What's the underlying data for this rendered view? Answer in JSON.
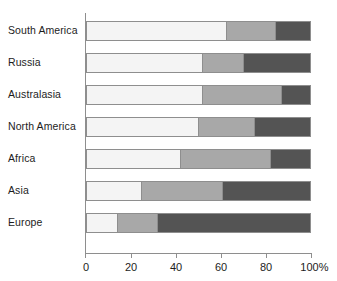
{
  "chart_data": {
    "type": "bar",
    "orientation": "horizontal",
    "stacked": true,
    "normalized": true,
    "title": "",
    "xlabel": "",
    "ylabel": "",
    "xlim": [
      0,
      100
    ],
    "grid": false,
    "legend": "none",
    "categories": [
      "South America",
      "Russia",
      "Australasia",
      "North America",
      "Africa",
      "Asia",
      "Europe"
    ],
    "series": [
      {
        "name": "segment-1",
        "color": "#f4f4f4",
        "values": [
          62.5,
          51.5,
          51.5,
          50.0,
          41.5,
          24.0,
          13.5
        ]
      },
      {
        "name": "segment-2",
        "color": "#a8a8a8",
        "values": [
          22.0,
          18.5,
          35.5,
          25.0,
          40.5,
          36.5,
          18.0
        ]
      },
      {
        "name": "segment-3",
        "color": "#545454",
        "values": [
          15.5,
          30.0,
          13.0,
          25.0,
          18.0,
          39.5,
          68.5
        ]
      }
    ],
    "cumulative_boundaries": [
      [
        62.5,
        84.5
      ],
      [
        51.5,
        70.0
      ],
      [
        51.5,
        87.0
      ],
      [
        50.0,
        75.0
      ],
      [
        41.5,
        82.0
      ],
      [
        24.0,
        60.5
      ],
      [
        13.5,
        31.5
      ]
    ],
    "x_ticks": [
      {
        "value": 0,
        "label": "0"
      },
      {
        "value": 20,
        "label": "20"
      },
      {
        "value": 40,
        "label": "40"
      },
      {
        "value": 60,
        "label": "60"
      },
      {
        "value": 80,
        "label": "80"
      },
      {
        "value": 100,
        "label": "100%"
      }
    ]
  },
  "colors": {
    "segment_1": "#f4f4f4",
    "segment_2": "#a8a8a8",
    "segment_3": "#545454",
    "axis": "#8e8e8e",
    "text": "#1d1d1d",
    "background": "#ffffff"
  }
}
